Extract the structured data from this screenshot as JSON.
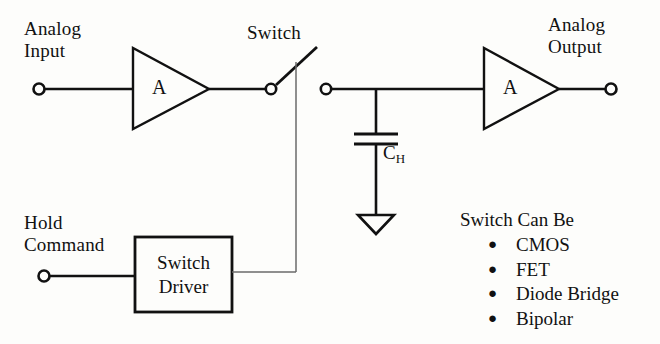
{
  "diagram": {
    "title_alt": "Sample-and-Hold Circuit",
    "background_color": "#fdfdfb",
    "line_color": "#111111",
    "labels": {
      "analog_input": "Analog\nInput",
      "analog_output": "Analog\nOutput",
      "switch": "Switch",
      "hold_command": "Hold\nCommand",
      "amplifier_1": "A",
      "amplifier_2": "A",
      "switch_driver_line1": "Switch",
      "switch_driver_line2": "Driver",
      "hold_capacitor": "C",
      "hold_capacitor_subscript": "H"
    },
    "switch_options": {
      "title": "Switch Can Be",
      "bullet_glyph": "●",
      "items": [
        {
          "label": "CMOS"
        },
        {
          "label": "FET"
        },
        {
          "label": "Diode Bridge"
        },
        {
          "label": "Bipolar"
        }
      ]
    },
    "nodes": {
      "input_terminal": "input-terminal",
      "output_terminal": "output-terminal",
      "hold_command_terminal": "hold-command-terminal",
      "switch_left_terminal": "switch-left-terminal",
      "switch_right_terminal": "switch-right-terminal",
      "ground_symbol": "ground-symbol"
    }
  }
}
